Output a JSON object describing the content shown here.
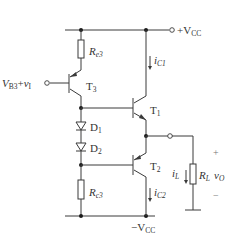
{
  "diagram": {
    "type": "circuit-schematic",
    "supply_positive": {
      "label": "+V",
      "sub": "CC"
    },
    "supply_negative": {
      "label": "−V",
      "sub": "CC"
    },
    "input": {
      "label": "V",
      "sub": "B3",
      "plus": "+",
      "signal": "v",
      "signal_sub": "I"
    },
    "transistors": [
      {
        "id": "T3",
        "label": "T",
        "sub": "3"
      },
      {
        "id": "T1",
        "label": "T",
        "sub": "1"
      },
      {
        "id": "T2",
        "label": "T",
        "sub": "2"
      }
    ],
    "diodes": [
      {
        "id": "D1",
        "label": "D",
        "sub": "1"
      },
      {
        "id": "D2",
        "label": "D",
        "sub": "2"
      }
    ],
    "resistors": [
      {
        "id": "Re3",
        "label": "R",
        "sub": "e3"
      },
      {
        "id": "Rc3",
        "label": "R",
        "sub": "c3"
      },
      {
        "id": "RL",
        "label": "R",
        "sub": "L"
      }
    ],
    "currents": [
      {
        "id": "iC1",
        "label": "i",
        "sub": "C1"
      },
      {
        "id": "iC2",
        "label": "i",
        "sub": "C2"
      },
      {
        "id": "iL",
        "label": "i",
        "sub": "L"
      }
    ],
    "output": {
      "label": "v",
      "sub": "O",
      "plus": "+",
      "minus": "−"
    }
  }
}
